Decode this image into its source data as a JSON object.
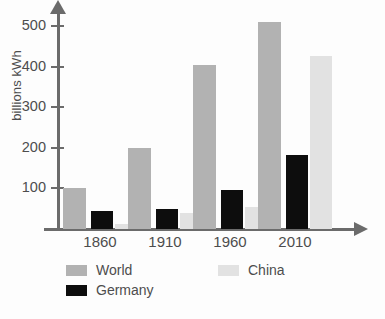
{
  "chart_data": {
    "type": "bar",
    "title": "",
    "subtitle": "",
    "xlabel": "",
    "ylabel": "billions kWh",
    "categories": [
      "1860",
      "1910",
      "1960",
      "2010"
    ],
    "series": [
      {
        "name": "World",
        "color": "#b2b2b2",
        "values": [
          100,
          200,
          405,
          510
        ]
      },
      {
        "name": "Germany",
        "color": "#0d0d0d",
        "values": [
          45,
          50,
          97,
          183
        ]
      },
      {
        "name": "China",
        "color": "#e2e2e2",
        "values": [
          12,
          40,
          55,
          427
        ]
      }
    ],
    "yticks": [
      100,
      200,
      300,
      400,
      500
    ],
    "ytick_labels": [
      "100",
      "200",
      "300",
      "400",
      "500"
    ],
    "ylim": [
      0,
      540
    ],
    "grid": false,
    "legend_position": "bottom",
    "legend_entries": [
      {
        "label": "World",
        "color": "#b2b2b2"
      },
      {
        "label": "Germany",
        "color": "#0d0d0d"
      },
      {
        "label": "China",
        "color": "#e2e2e2"
      }
    ],
    "axis_color": "#6b6b6b",
    "text_color": "#4d4d4d",
    "background": "#fdfdfd"
  }
}
